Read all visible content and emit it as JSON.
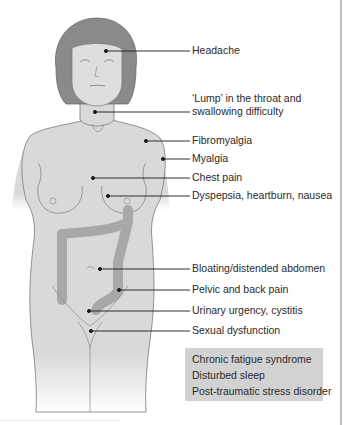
{
  "figure": {
    "colors": {
      "skin": "#d9d9d9",
      "hair": "#8a8a8a",
      "colon": "#a8a8a8",
      "outline": "#6e6e6e",
      "leader": "#1a1a1a",
      "box_bg": "#d2d2d2",
      "text": "#2a2a2a"
    }
  },
  "labels": [
    {
      "id": "headache",
      "text": "Headache"
    },
    {
      "id": "lump-1",
      "text": "‘Lump’ in the throat and"
    },
    {
      "id": "lump-2",
      "text": "swallowing difficulty"
    },
    {
      "id": "fibromyalgia",
      "text": "Fibromyalgia"
    },
    {
      "id": "myalgia",
      "text": "Myalgia"
    },
    {
      "id": "chest-pain",
      "text": "Chest pain"
    },
    {
      "id": "dyspepsia",
      "text": "Dyspepsia, heartburn, nausea"
    },
    {
      "id": "bloating",
      "text": "Bloating/distended abdomen"
    },
    {
      "id": "pelvic",
      "text": "Pelvic and back pain"
    },
    {
      "id": "urinary",
      "text": "Urinary urgency, cystitis"
    },
    {
      "id": "sexual",
      "text": "Sexual dysfunction"
    }
  ],
  "systemic_box": {
    "items": [
      "Chronic fatigue syndrome",
      "Disturbed sleep",
      "Post-traumatic stress disorder"
    ]
  }
}
